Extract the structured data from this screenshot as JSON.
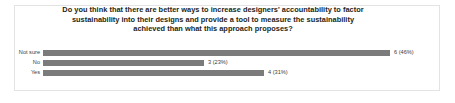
{
  "chart_data": {
    "type": "bar",
    "orientation": "horizontal",
    "title_lines": [
      "Do you think that there are better ways to increase designers' accountability to factor",
      "sustainability into their designs and provide a tool to measure the sustainability",
      "achieved than what this approach proposes?"
    ],
    "xlabel": "",
    "ylabel": "",
    "grid": false,
    "legend": "none",
    "xlim": [
      0,
      6.5
    ],
    "categories": [
      "Not sure",
      "No",
      "Yes"
    ],
    "values": [
      6,
      3,
      4
    ],
    "percentages": [
      "46%",
      "23%",
      "31%"
    ],
    "data_labels": [
      "6 (46%)",
      "3 (23%)",
      "4 (31%)"
    ],
    "bars": [
      {
        "category": "Not sure",
        "value": 6,
        "percent": "46%",
        "label": "6 (46%)",
        "width_px": 347
      },
      {
        "category": "No",
        "value": 3,
        "percent": "23%",
        "label": "3 (23%)",
        "width_px": 161
      },
      {
        "category": "Yes",
        "value": 4,
        "percent": "31%",
        "label": "4 (31%)",
        "width_px": 221
      }
    ],
    "colors": {
      "bar": "#7b7b7b",
      "text": "#3b3b3b",
      "title": "#231f20",
      "frame_border": "#e3e3e3",
      "background": "#ffffff"
    }
  }
}
